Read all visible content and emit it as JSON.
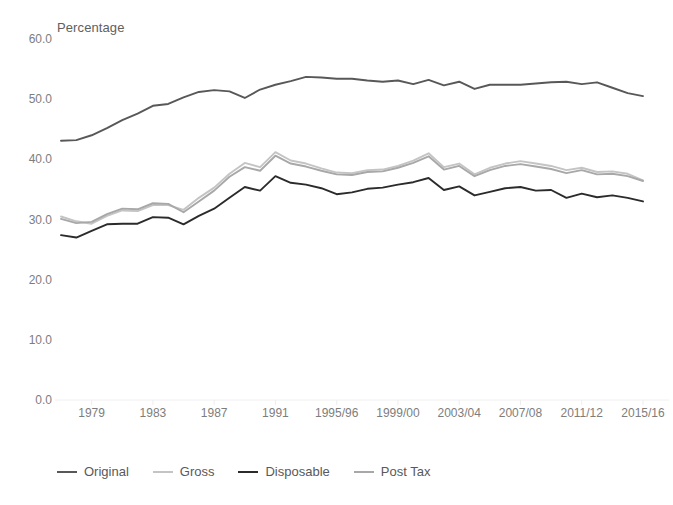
{
  "chart_data": {
    "type": "line",
    "title": "",
    "subtitle": "",
    "ylabel": "Percentage",
    "xlabel": "",
    "ylim": [
      0,
      60
    ],
    "yticks": [
      0.0,
      10.0,
      20.0,
      30.0,
      40.0,
      50.0,
      60.0
    ],
    "ytick_labels": [
      "0.0",
      "10.0",
      "20.0",
      "30.0",
      "40.0",
      "50.0",
      "60.0"
    ],
    "grid": false,
    "legend_position": "bottom-left",
    "x": [
      "1977",
      "1978",
      "1979",
      "1980",
      "1981",
      "1982",
      "1983",
      "1984",
      "1985",
      "1986",
      "1987",
      "1988",
      "1989",
      "1990",
      "1991",
      "1992",
      "1993",
      "1994/95",
      "1995/96",
      "1996/97",
      "1997/98",
      "1998/99",
      "1999/00",
      "2000/01",
      "2001/02",
      "2002/03",
      "2003/04",
      "2004/05",
      "2005/06",
      "2006/07",
      "2007/08",
      "2008/09",
      "2009/10",
      "2010/11",
      "2011/12",
      "2012/13",
      "2013/14",
      "2014/15",
      "2015/16"
    ],
    "xtick_labels": [
      "1979",
      "1983",
      "1987",
      "1991",
      "1995/96",
      "1999/00",
      "2003/04",
      "2007/08",
      "2011/12",
      "2015/16"
    ],
    "xtick_indices": [
      2,
      6,
      10,
      14,
      18,
      22,
      26,
      30,
      34,
      38
    ],
    "series": [
      {
        "name": "Original",
        "color": "#585858",
        "values": [
          43.1,
          43.2,
          44.0,
          45.2,
          46.5,
          47.6,
          48.9,
          49.2,
          50.3,
          51.2,
          51.5,
          51.3,
          50.2,
          51.6,
          52.4,
          53.0,
          53.7,
          53.6,
          53.4,
          53.4,
          53.1,
          52.9,
          53.1,
          52.5,
          53.2,
          52.3,
          52.9,
          51.7,
          52.4,
          52.4,
          52.4,
          52.6,
          52.8,
          52.9,
          52.5,
          52.8,
          51.9,
          51.0,
          50.5
        ]
      },
      {
        "name": "Gross",
        "color": "#c4c4c4",
        "values": [
          30.5,
          29.7,
          29.3,
          30.6,
          31.5,
          31.4,
          32.4,
          32.4,
          31.6,
          33.6,
          35.3,
          37.6,
          39.4,
          38.7,
          41.2,
          39.8,
          39.3,
          38.5,
          37.8,
          37.7,
          38.2,
          38.3,
          38.9,
          39.8,
          41.0,
          38.7,
          39.3,
          37.5,
          38.6,
          39.3,
          39.7,
          39.3,
          38.9,
          38.2,
          38.6,
          37.9,
          38.0,
          37.6,
          36.5
        ]
      },
      {
        "name": "Disposable",
        "color": "#2b2b2b",
        "values": [
          27.4,
          27.0,
          28.1,
          29.2,
          29.3,
          29.3,
          30.4,
          30.3,
          29.2,
          30.6,
          31.8,
          33.6,
          35.4,
          34.8,
          37.2,
          36.1,
          35.8,
          35.2,
          34.2,
          34.5,
          35.1,
          35.3,
          35.8,
          36.2,
          36.9,
          34.9,
          35.5,
          34.0,
          34.6,
          35.2,
          35.4,
          34.8,
          34.9,
          33.6,
          34.3,
          33.7,
          34.0,
          33.6,
          33.0
        ]
      },
      {
        "name": "Post Tax",
        "color": "#a8a8a8",
        "values": [
          30.1,
          29.4,
          29.6,
          30.9,
          31.8,
          31.7,
          32.7,
          32.6,
          31.2,
          33.0,
          34.8,
          37.1,
          38.7,
          38.1,
          40.6,
          39.3,
          38.8,
          38.1,
          37.5,
          37.4,
          37.9,
          38.0,
          38.6,
          39.4,
          40.5,
          38.3,
          38.9,
          37.2,
          38.2,
          38.9,
          39.2,
          38.8,
          38.4,
          37.7,
          38.2,
          37.5,
          37.6,
          37.2,
          36.4
        ]
      }
    ]
  },
  "legend": {
    "items": [
      {
        "label": "Original",
        "color": "#585858"
      },
      {
        "label": "Gross",
        "color": "#c4c4c4"
      },
      {
        "label": "Disposable",
        "color": "#2b2b2b"
      },
      {
        "label": "Post Tax",
        "color": "#a8a8a8"
      }
    ]
  },
  "axis": {
    "y_title": "Percentage"
  }
}
